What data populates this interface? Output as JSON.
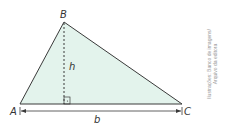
{
  "figure": {
    "vertices": {
      "A": "A",
      "B": "B",
      "C": "C"
    },
    "height_label": "h",
    "base_label": "b",
    "fill_color": "#e3f3ec",
    "stroke_color": "#3a3a3a"
  },
  "credit": {
    "line1": "Ilustrações: Banco de imagens/",
    "line2": "Arquivo da editora"
  }
}
